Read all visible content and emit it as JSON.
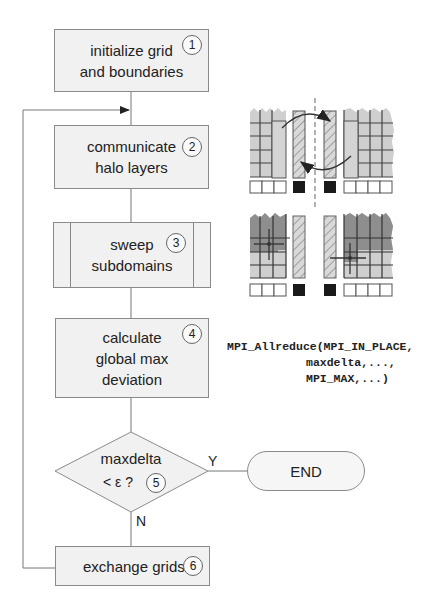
{
  "flowchart": {
    "steps": [
      {
        "id": 1,
        "label": "initialize grid\nand boundaries",
        "shape": "process"
      },
      {
        "id": 2,
        "label": "communicate\nhalo layers",
        "shape": "process"
      },
      {
        "id": 3,
        "label": "sweep\nsubdomains",
        "shape": "subroutine"
      },
      {
        "id": 4,
        "label": "calculate\nglobal max\ndeviation",
        "shape": "process"
      },
      {
        "id": 5,
        "label_line1": "maxdelta",
        "label_line2": "< ε ?",
        "shape": "decision"
      },
      {
        "id": 6,
        "label": "exchange grids",
        "shape": "process"
      }
    ],
    "terminal": {
      "label": "END"
    },
    "branches": {
      "yes": "Y",
      "no": "N"
    },
    "numbers": [
      "1",
      "2",
      "3",
      "4",
      "5",
      "6"
    ]
  },
  "code": {
    "line1": "MPI_Allreduce(MPI_IN_PLACE,",
    "line2": "maxdelta,...,",
    "line3": "MPI_MAX,...)"
  },
  "illustrations": {
    "halo_exchange": {
      "description": "two subdomains exchanging hatched halo columns across dashed boundary"
    },
    "sweep": {
      "description": "two subdomains with stencil update, darker swept region"
    }
  },
  "colors": {
    "box_fill": "#f1f1f1",
    "stroke": "#8a8a8a",
    "grid_light": "#cfcfcf",
    "grid_dark": "#8e8e8e",
    "halo_dark": "#1a1a1a"
  }
}
